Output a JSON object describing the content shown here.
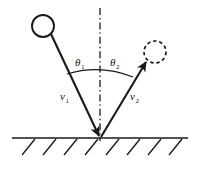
{
  "figure": {
    "background_color": "#ffffff",
    "line_color": "#1a1a1a",
    "labels": {
      "theta_incident": "θ",
      "theta_incident_sub": "1",
      "theta_reflected": "θ",
      "theta_reflected_sub": "2",
      "velocity_incident": "v",
      "velocity_incident_sub": "1",
      "velocity_reflected": "v",
      "velocity_reflected_sub": "2"
    },
    "elements": {
      "incoming_ball": "solid-circle",
      "outgoing_ball": "dashed-circle",
      "normal_line": "dash-dot-vertical",
      "ground": "solid-horizontal-line",
      "hatching": "diagonal-hatch-marks",
      "incident_vector": "arrow-down-right",
      "reflected_vector": "arrow-up-right",
      "angle_arc": "arc-between-vectors"
    },
    "geometry": {
      "impact_point_x": 100,
      "impact_point_y": 138,
      "incoming_ball_cx": 43,
      "incoming_ball_cy": 26,
      "incoming_ball_r": 11,
      "outgoing_ball_cx": 155,
      "outgoing_ball_cy": 52,
      "outgoing_ball_r": 11,
      "ground_y": 138,
      "ground_x_start": 12,
      "ground_x_end": 188,
      "normal_top_y": 8,
      "hatch_count": 8
    }
  }
}
